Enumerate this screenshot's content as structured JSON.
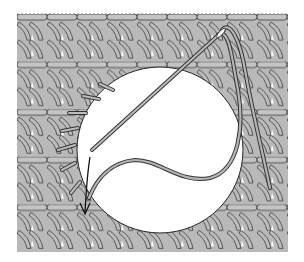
{
  "figure": {
    "background": "#ffffff",
    "fabric": {
      "color": "#b9b9b9",
      "stroke": "#3a3a3a",
      "gap_color": "#ffffff",
      "x": 17,
      "y": 14,
      "width": 271,
      "height": 238,
      "row_count": 5
    },
    "hole": {
      "cx": 160,
      "cy": 150,
      "r": 83,
      "color": "#ffffff"
    },
    "needle": {
      "color": "#bdbdbd",
      "outline": "#333333"
    },
    "thread": {
      "color": "#b5b5b5",
      "outline": "#333333"
    },
    "arrow": {
      "color": "#111111"
    },
    "stitch_marks": 7
  }
}
